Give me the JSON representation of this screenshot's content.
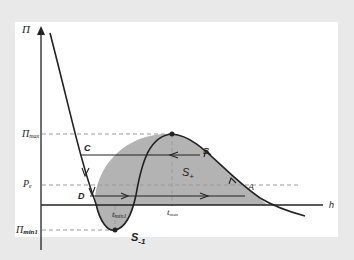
{
  "diagram": {
    "type": "disjoining pressure isotherm",
    "axes": {
      "y_label": "Π",
      "x_label": "h"
    },
    "y_ticks": [
      {
        "label": "Π",
        "sub": "max"
      },
      {
        "label": "P",
        "sub": "e"
      },
      {
        "label": "Π",
        "sub": "min1"
      }
    ],
    "x_ticks": [
      {
        "label": "t",
        "sub": "max"
      },
      {
        "label": "t",
        "sub": "min1"
      }
    ],
    "points": [
      "A",
      "B",
      "C",
      "D"
    ],
    "areas": [
      {
        "label": "S",
        "sub": "+"
      },
      {
        "label": "S",
        "sub": "-1"
      }
    ],
    "colors": {
      "background": "#e9e9e9",
      "frame": "#ffffff",
      "curve": "#222222",
      "fill": "#b3b3b3",
      "dashed": "#999999"
    }
  }
}
